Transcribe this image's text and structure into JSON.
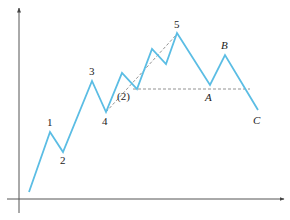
{
  "diagram": {
    "type": "elliott-wave",
    "colors": {
      "wave": "#5bbde4",
      "axis": "#555555",
      "dashed": "#777777",
      "text": "#222222"
    },
    "axes": {
      "x": {
        "x1": 7,
        "y": 199,
        "x2": 284
      },
      "y": {
        "x": 19,
        "y1": 213,
        "y2": 8
      }
    },
    "wave_points": [
      [
        29,
        192
      ],
      [
        50,
        132
      ],
      [
        63,
        152
      ],
      [
        92,
        81
      ],
      [
        106,
        112
      ],
      [
        122,
        73
      ],
      [
        137,
        89
      ],
      [
        152,
        49
      ],
      [
        166,
        64
      ],
      [
        177,
        33
      ],
      [
        210,
        85
      ],
      [
        225,
        55
      ],
      [
        258,
        110
      ]
    ],
    "dashed_lines": [
      {
        "name": "trend-line-4-to-5",
        "x1": 106,
        "y1": 112,
        "x2": 177,
        "y2": 34
      },
      {
        "name": "support-line",
        "x1": 133,
        "y1": 89,
        "x2": 250,
        "y2": 89
      }
    ],
    "labels": {
      "p1": {
        "text": "1",
        "x": 47,
        "y": 126
      },
      "p2": {
        "text": "2",
        "x": 60,
        "y": 164
      },
      "p3": {
        "text": "3",
        "x": 89,
        "y": 75
      },
      "p4": {
        "text": "4",
        "x": 102,
        "y": 125
      },
      "p5": {
        "text": "5",
        "x": 174,
        "y": 28
      },
      "sub2": {
        "text": "(2)",
        "x": 117,
        "y": 100
      },
      "A": {
        "text": "A",
        "x": 205,
        "y": 101
      },
      "B": {
        "text": "B",
        "x": 221,
        "y": 49
      },
      "C": {
        "text": "C",
        "x": 253,
        "y": 124
      }
    }
  }
}
